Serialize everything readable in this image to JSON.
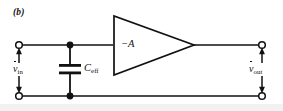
{
  "figure": {
    "panel_label": "(b)",
    "caption_style": "italic-bold",
    "width": 283,
    "height": 111,
    "background_color": "#ffffff",
    "line_color": "#111111"
  },
  "labels": {
    "gain": "−A",
    "gain_plain": "-A",
    "capacitor_symbol": "C",
    "capacitor_subscript": "eff",
    "input_voltage_symbol": "v",
    "input_voltage_subscript": "in",
    "output_voltage_symbol": "v",
    "output_voltage_subscript": "out"
  },
  "components": [
    {
      "name": "input-terminal-top",
      "type": "open-terminal",
      "x": 19,
      "y": 45
    },
    {
      "name": "input-terminal-bottom",
      "type": "open-terminal",
      "x": 19,
      "y": 96
    },
    {
      "name": "output-terminal-top",
      "type": "open-terminal",
      "x": 262,
      "y": 45
    },
    {
      "name": "output-terminal-bottom",
      "type": "open-terminal",
      "x": 262,
      "y": 96
    },
    {
      "name": "node-top",
      "type": "junction-dot",
      "x": 70,
      "y": 45
    },
    {
      "name": "node-bottom",
      "type": "junction-dot",
      "x": 70,
      "y": 96
    },
    {
      "name": "capacitor-ceff",
      "type": "capacitor",
      "x": 70,
      "y": 69
    },
    {
      "name": "amplifier-triangle",
      "type": "inverting-amplifier",
      "apex_x": 194,
      "apex_y": 45
    }
  ],
  "annotations": {
    "input_arrow_direction": "bidirectional-vertical",
    "output_arrow_direction": "bidirectional-vertical"
  }
}
